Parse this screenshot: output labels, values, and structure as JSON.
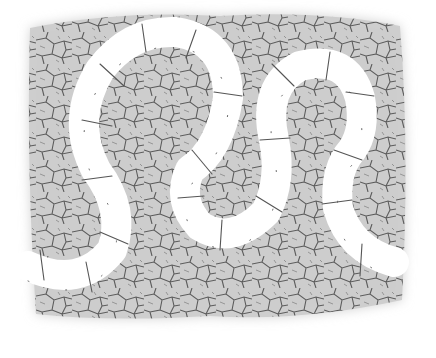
{
  "image": {
    "subject": "cracked-earth texture with white serpentine band",
    "colors": {
      "background": "#ffffff",
      "ground": "#cdcdcd",
      "crack": "#4a4a4a",
      "band": "#ffffff"
    }
  }
}
